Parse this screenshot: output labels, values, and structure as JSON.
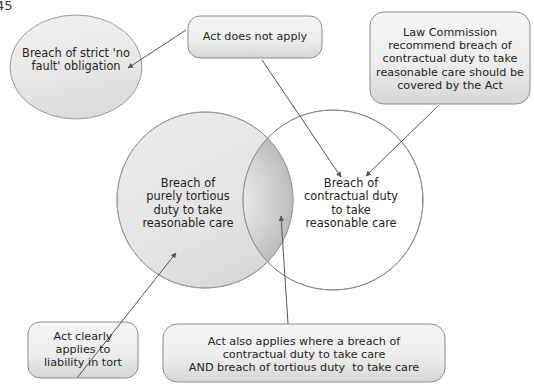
{
  "page": {
    "page_number": "45",
    "width": 534,
    "height": 385
  },
  "colors": {
    "outline": "#8b8b8b",
    "box_fill_top": "#f3f3f3",
    "box_fill_bottom": "#d9d9d9",
    "circle_fill": "#e6e6e6",
    "lens_center": "#f4f4f4",
    "lens_edge": "#a8a8a8",
    "text": "#231f20",
    "arrow": "#5a5a63"
  },
  "shapes": {
    "strict_liability_ellipse": {
      "label": "Breach of strict 'no\nfault' obligation",
      "shape": "ellipse"
    },
    "act_does_not_apply_box": {
      "label": "Act does not apply",
      "shape": "rounded-rect"
    },
    "law_commission_box": {
      "label": "Law Commission\nrecommend breach of\ncontractual duty to take\nreasonable care should be\ncovered by the Act",
      "shape": "rounded-rect"
    },
    "tortious_duty_circle": {
      "label": "Breach of\npurely tortious\nduty to take\nreasonable care",
      "shape": "circle"
    },
    "contractual_duty_circle": {
      "label": "Breach of\ncontractual duty\nto take\nreasonable care",
      "shape": "circle"
    },
    "intersection_lens": {
      "label": "",
      "shape": "lens"
    },
    "act_clearly_applies_box": {
      "label": "Act clearly\napplies to\nliability in tort",
      "shape": "rounded-rect"
    },
    "act_also_applies_box": {
      "label": "Act also applies where a breach of\ncontractual duty to take care\nAND breach of tortious duty  to take care",
      "shape": "rounded-rect"
    }
  },
  "connectors": [
    {
      "name": "act-not-apply-to-strict-ellipse",
      "from": "act_does_not_apply_box",
      "to": "strict_liability_ellipse"
    },
    {
      "name": "act-not-apply-to-contractual-circle",
      "from": "act_does_not_apply_box",
      "to": "contractual_duty_circle"
    },
    {
      "name": "law-commission-to-contractual-circle",
      "from": "law_commission_box",
      "to": "contractual_duty_circle"
    },
    {
      "name": "act-clearly-to-tortious-circle",
      "from": "act_clearly_applies_box",
      "to": "tortious_duty_circle"
    },
    {
      "name": "act-also-to-intersection",
      "from": "act_also_applies_box",
      "to": "intersection_lens"
    }
  ]
}
